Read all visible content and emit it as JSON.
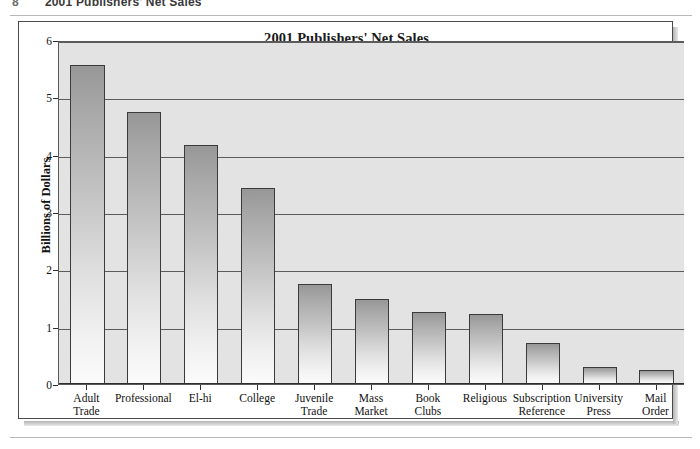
{
  "running_header": {
    "page_number": "8",
    "text": "2001 Publishers' Net Sales"
  },
  "chart_data": {
    "type": "bar",
    "title": "2001 Publishers' Net Sales",
    "xlabel": "",
    "ylabel": "Billions of Dollars",
    "ylim": [
      0,
      6
    ],
    "ytick_labels": [
      "0",
      "1",
      "2",
      "3",
      "4",
      "5",
      "6"
    ],
    "ytick_values": [
      0,
      1,
      2,
      3,
      4,
      5,
      6
    ],
    "grid": true,
    "legend": "none",
    "categories": [
      "Adult Trade",
      "Professional",
      "El-hi",
      "College",
      "Juvenile Trade",
      "Mass Market",
      "Book Clubs",
      "Religious",
      "Subscription Reference",
      "University Press",
      "Mail Order"
    ],
    "category_lines": [
      [
        "Adult",
        "Trade"
      ],
      [
        "Professional"
      ],
      [
        "El-hi"
      ],
      [
        "College"
      ],
      [
        "Juvenile",
        "Trade"
      ],
      [
        "Mass",
        "Market"
      ],
      [
        "Book",
        "Clubs"
      ],
      [
        "Religious"
      ],
      [
        "Subscription",
        "Reference"
      ],
      [
        "University",
        "Press"
      ],
      [
        "Mail",
        "Order"
      ]
    ],
    "values": [
      5.57,
      4.74,
      4.17,
      3.42,
      1.75,
      1.48,
      1.26,
      1.22,
      0.72,
      0.3,
      0.25
    ]
  },
  "colors": {
    "plot_background": "#e3e3e3",
    "gridline": "#5c5c5c",
    "bar_top": "#979797",
    "bar_bottom": "#fbfbfb",
    "bar_border": "#3b3b3b",
    "axis": "#2e2e2e",
    "text": "#111111",
    "frame": "#4a4a4a",
    "page_background": "#ffffff"
  }
}
